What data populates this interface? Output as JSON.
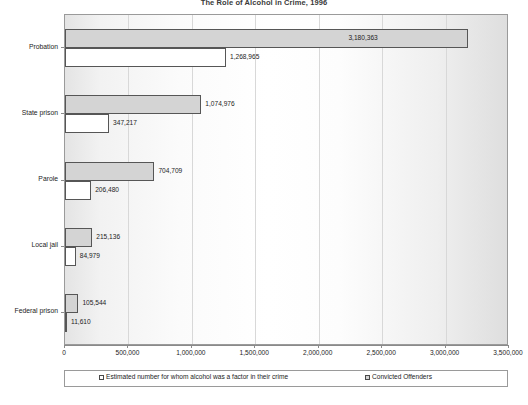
{
  "chart_data": {
    "type": "bar",
    "orientation": "horizontal",
    "title": "The Role of Alcohol in Crime, 1996",
    "xlabel": "",
    "ylabel": "",
    "xlim": [
      0,
      3500000
    ],
    "xticks": [
      0,
      500000,
      1000000,
      1500000,
      2000000,
      2500000,
      3000000,
      3500000
    ],
    "xtick_labels": [
      "0",
      "500,000",
      "1,000,000",
      "1,500,000",
      "2,000,000",
      "2,500,000",
      "3,000,000",
      "3,500,000"
    ],
    "categories": [
      "Probation",
      "State prison",
      "Parole",
      "Local jail",
      "Federal prison"
    ],
    "grid": true,
    "legend_position": "bottom",
    "series": [
      {
        "name": "Convicted Offenders",
        "color": "#d4d4d4",
        "values": [
          3180363,
          1074976,
          704709,
          215136,
          105544
        ],
        "labels": [
          "3,180,363",
          "1,074,976",
          "704,709",
          "215,136",
          "105,544"
        ]
      },
      {
        "name": "Estimated number for whom alcohol was a factor in their crime",
        "color": "#ffffff",
        "values": [
          1268965,
          347217,
          206480,
          84979,
          11610
        ],
        "labels": [
          "1,268,965",
          "347,217",
          "206,480",
          "84,979",
          "11,610"
        ]
      }
    ]
  },
  "legend": {
    "entries": [
      {
        "label": "Estimated number for whom alcohol was a factor in their crime",
        "swatch": "white"
      },
      {
        "label": "Convicted Offenders",
        "swatch": "gray"
      }
    ]
  }
}
